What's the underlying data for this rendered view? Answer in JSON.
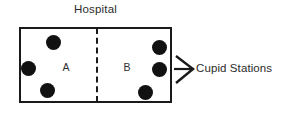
{
  "figure": {
    "title": "Hospital",
    "width": 282,
    "height": 116,
    "background_color": "#ffffff",
    "ink_color": "#1a1a1a"
  },
  "diagram": {
    "type": "schematic",
    "outer_box": {
      "label": "Hospital",
      "border_color": "#1a1a1a",
      "border_width_px": 2,
      "x": 19,
      "y": 27,
      "width": 153,
      "height": 76
    },
    "divider": {
      "name": "partition",
      "style": "dashed",
      "orientation": "vertical",
      "x": 96,
      "color": "#1a1a1a"
    },
    "wards": [
      {
        "label": "A",
        "label_x": 66,
        "label_y": 67,
        "dot_count": 3,
        "dots": [
          {
            "cx": 53,
            "cy": 42,
            "r": 7.5
          },
          {
            "cx": 28,
            "cy": 68,
            "r": 7.5
          },
          {
            "cx": 47,
            "cy": 90,
            "r": 7.5
          }
        ]
      },
      {
        "label": "B",
        "label_x": 127,
        "label_y": 67,
        "dot_count": 3,
        "dots": [
          {
            "cx": 159,
            "cy": 47,
            "r": 7.5
          },
          {
            "cx": 159,
            "cy": 69,
            "r": 7.5
          },
          {
            "cx": 145,
            "cy": 92,
            "r": 7.5
          }
        ]
      }
    ],
    "annotation": {
      "icon": "arrow-right-icon",
      "label": "Cupid Stations",
      "label_x": 196,
      "label_y": 62
    },
    "dot_color": "#111111",
    "total_dots": 6
  }
}
